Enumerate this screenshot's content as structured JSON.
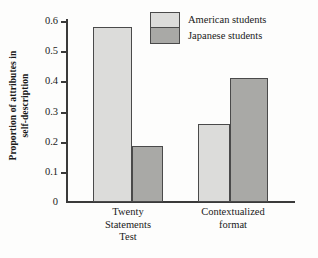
{
  "chart_data": {
    "type": "bar",
    "title": "",
    "xlabel": "",
    "ylabel_line1": "Proportion of attributes in",
    "ylabel_line2": "self-description",
    "categories": [
      "Twenty Statements Test",
      "Contextualized format"
    ],
    "category_lines": [
      [
        "Twenty",
        "Statements",
        "Test"
      ],
      [
        "Contextualized",
        "format"
      ]
    ],
    "series": [
      {
        "name": "American students",
        "values": [
          0.58,
          0.26
        ],
        "color": "#dcdcda"
      },
      {
        "name": "Japanese students",
        "values": [
          0.185,
          0.41
        ],
        "color": "#a9a9a6"
      }
    ],
    "ylim": [
      0,
      0.6
    ],
    "yticks": [
      0,
      0.1,
      0.2,
      0.3,
      0.4,
      0.5,
      0.6
    ],
    "ytick_labels": [
      "0",
      "0.1",
      "0.2",
      "0.3",
      "0.4",
      "0.5",
      "0.6"
    ],
    "grid": false,
    "legend_position": "top-right"
  },
  "legend": {
    "american_label": "American students",
    "japanese_label": "Japanese students"
  },
  "axis": {
    "ylabel_line1": "Proportion of attributes in",
    "ylabel_line2": "self-description",
    "tick_0": "0",
    "tick_1": "0.1",
    "tick_2": "0.2",
    "tick_3": "0.3",
    "tick_4": "0.4",
    "tick_5": "0.5",
    "tick_6": "0.6"
  },
  "categories": {
    "cat1_line1": "Twenty",
    "cat1_line2": "Statements",
    "cat1_line3": "Test",
    "cat2_line1": "Contextualized",
    "cat2_line2": "format"
  }
}
